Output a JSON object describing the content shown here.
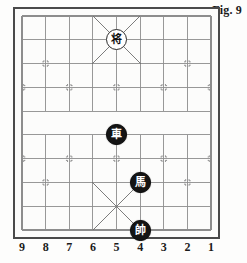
{
  "figure": {
    "caption": "Fig. 9"
  },
  "board": {
    "type": "xiangqi-board",
    "files": 9,
    "ranks": 10,
    "file_labels": [
      "9",
      "8",
      "7",
      "6",
      "5",
      "4",
      "3",
      "2",
      "1"
    ],
    "river": {
      "present": true,
      "text": ""
    },
    "palace_top": {
      "files": [
        "6",
        "5",
        "4"
      ],
      "ranks": [
        0,
        1,
        2
      ]
    },
    "palace_bottom": {
      "files": [
        "6",
        "5",
        "4"
      ],
      "ranks": [
        7,
        8,
        9
      ]
    },
    "star_points": {
      "cannon_rank_top": {
        "rank": 2,
        "files": [
          "8",
          "2"
        ]
      },
      "soldier_rank_top": {
        "rank": 3,
        "files": [
          "9",
          "7",
          "5",
          "3",
          "1"
        ]
      },
      "soldier_rank_bottom": {
        "rank": 6,
        "files": [
          "9",
          "7",
          "5",
          "3",
          "1"
        ]
      },
      "cannon_rank_bottom": {
        "rank": 7,
        "files": [
          "8",
          "2"
        ]
      }
    }
  },
  "pieces": [
    {
      "id": "black-general",
      "glyph": "将",
      "color": "light",
      "file": "5",
      "rank": 1,
      "name": "piece-jiang-general"
    },
    {
      "id": "black-chariot",
      "glyph": "車",
      "color": "dark",
      "file": "5",
      "rank": 5,
      "name": "piece-ju-chariot"
    },
    {
      "id": "black-horse",
      "glyph": "馬",
      "color": "dark",
      "file": "4",
      "rank": 7,
      "name": "piece-ma-horse"
    },
    {
      "id": "red-marshal",
      "glyph": "帥",
      "color": "dark",
      "file": "4",
      "rank": 9,
      "name": "piece-shuai-marshal"
    }
  ],
  "colors": {
    "paper": "#fdfdfc",
    "border": "#4a4a4a",
    "grid_line": "#8d8d8d",
    "palace_line": "#6e6e6e",
    "piece_dark_fill": "#141414",
    "piece_light_fill": "#ffffff",
    "text": "#1a1a1a"
  }
}
